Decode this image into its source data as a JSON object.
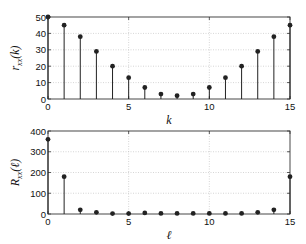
{
  "chart_data": [
    {
      "type": "stem",
      "title": "",
      "xlabel": "k",
      "ylabel": "r_xx(k)",
      "ylabel_main": "r",
      "ylabel_sub": "xx",
      "ylabel_arg": "(k)",
      "x": [
        0,
        1,
        2,
        3,
        4,
        5,
        6,
        7,
        8,
        9,
        10,
        11,
        12,
        13,
        14,
        15
      ],
      "values": [
        50,
        45,
        38,
        29,
        20,
        13,
        7,
        3,
        2,
        3,
        7,
        13,
        20,
        29,
        38,
        45
      ],
      "xlim": [
        0,
        15
      ],
      "ylim": [
        0,
        50
      ],
      "xticks": [
        "0",
        "5",
        "10",
        "15"
      ],
      "yticks": [
        "0",
        "10",
        "20",
        "30",
        "40",
        "50"
      ],
      "grid": true
    },
    {
      "type": "stem",
      "title": "",
      "xlabel": "ℓ",
      "ylabel": "R_xx(ℓ)",
      "ylabel_main": "R",
      "ylabel_sub": "xx",
      "ylabel_arg": "(ℓ)",
      "x": [
        0,
        1,
        2,
        3,
        4,
        5,
        6,
        7,
        8,
        9,
        10,
        11,
        12,
        13,
        14,
        15
      ],
      "values": [
        360,
        180,
        20,
        8,
        2,
        2,
        5,
        3,
        3,
        3,
        3,
        3,
        3,
        8,
        20,
        180
      ],
      "xlim": [
        0,
        15
      ],
      "ylim": [
        0,
        400
      ],
      "xticks": [
        "0",
        "5",
        "10",
        "15"
      ],
      "yticks": [
        "0",
        "100",
        "200",
        "300",
        "400"
      ],
      "grid": true
    }
  ],
  "colors": {
    "stem": "#222222",
    "axis": "#333333",
    "grid": "#bbbbbb"
  }
}
